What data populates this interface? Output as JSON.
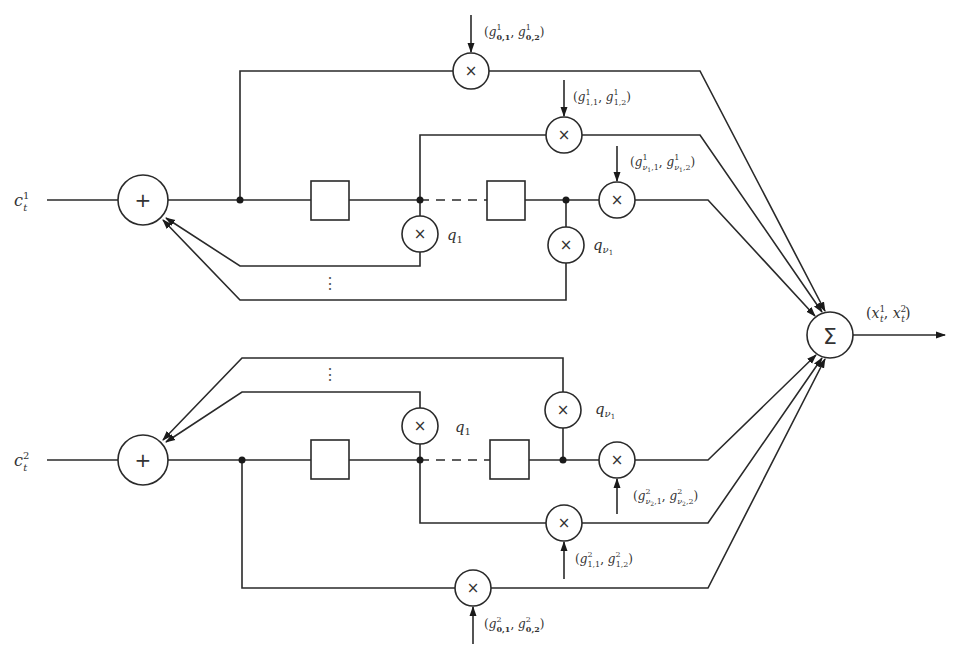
{
  "diagram": {
    "inputs": {
      "top": "c_t^1",
      "bottom": "c_t^2"
    },
    "output": {
      "label": "(x_t^1, x_t^2)",
      "node_symbol": "Σ"
    },
    "symbols": {
      "adder": "+",
      "multiplier": "×",
      "sum": "Σ"
    },
    "top_chain": {
      "feedback_taps": [
        "q_1",
        "q_ν1"
      ],
      "output_taps": [
        "(g^1_{0,1}, g^1_{0,2})",
        "(g^1_{1,1}, g^1_{1,2})",
        "(g^1_{ν1,1}, g^1_{ν1,2})"
      ]
    },
    "bottom_chain": {
      "feedback_taps": [
        "q_1",
        "q_ν1"
      ],
      "output_taps": [
        "(g^2_{0,1}, g^2_{0,2})",
        "(g^2_{1,1}, g^2_{1,2})",
        "(g^2_{ν2,1}, g^2_{ν2,2})"
      ]
    },
    "label_parts": {
      "c": "c",
      "t": "t",
      "one": "1",
      "two": "2",
      "q": "q",
      "q_sub_1": "1",
      "q_sub_nu": "ν",
      "nu_sub_1": "1",
      "g": "g",
      "x": "x",
      "lp": "(",
      "rp": ")",
      "comma": ", ",
      "sub_01": "0,1",
      "sub_02": "0,2",
      "sub_11": "1,1",
      "sub_12": "1,2",
      "nu1": "ν",
      "nu_idx1": "1",
      "nu_idx2": "2",
      "sub_c1": ",1",
      "sub_c2": ",2",
      "vdots": "⋮"
    }
  }
}
